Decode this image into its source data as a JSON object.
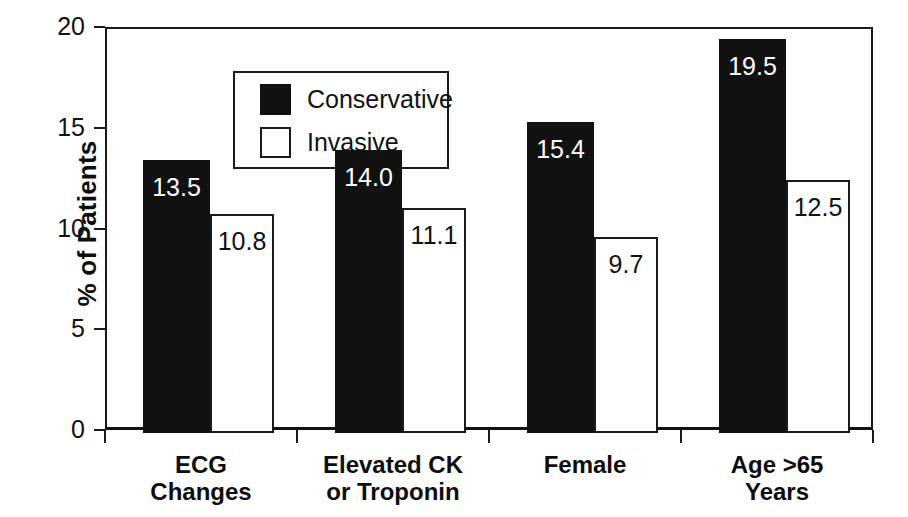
{
  "chart_data": {
    "type": "bar",
    "title": "",
    "xlabel": "",
    "ylabel": "% of Patients",
    "ylim": [
      0,
      20
    ],
    "yticks": [
      0,
      5,
      10,
      15,
      20
    ],
    "grid": false,
    "legend_position": "inside-top-left",
    "categories": [
      "ECG Changes",
      "Elevated CK or Troponin",
      "Female",
      "Age >65 Years"
    ],
    "category_lines": [
      [
        "ECG",
        "Changes"
      ],
      [
        "Elevated CK",
        "or Troponin"
      ],
      [
        "Female",
        ""
      ],
      [
        "Age >65",
        "Years"
      ]
    ],
    "series": [
      {
        "name": "Conservative",
        "color": "#111111",
        "style": "filled",
        "values": [
          13.5,
          14.0,
          15.4,
          19.5
        ],
        "labels": [
          "13.5",
          "14.0",
          "15.4",
          "19.5"
        ]
      },
      {
        "name": "Invasive",
        "color": "#ffffff",
        "style": "hollow",
        "values": [
          10.8,
          11.1,
          9.7,
          12.5
        ],
        "labels": [
          "10.8",
          "11.1",
          "9.7",
          "12.5"
        ]
      }
    ]
  },
  "axes": {
    "y_tick_labels": [
      "0",
      "5",
      "10",
      "15",
      "20"
    ],
    "y_axis_title": "% of Patients"
  },
  "legend": {
    "entries": [
      {
        "label": "Conservative",
        "swatch": "filled-square-icon"
      },
      {
        "label": "Invasive",
        "swatch": "hollow-square-icon"
      }
    ]
  }
}
